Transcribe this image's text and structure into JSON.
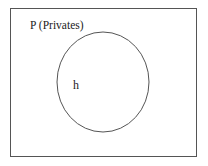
{
  "diagram": {
    "type": "venn",
    "universe": {
      "label": "P (Privates)"
    },
    "sets": [
      {
        "label": "h"
      }
    ],
    "colors": {
      "stroke": "#555555",
      "background": "#ffffff",
      "text": "#222222"
    }
  }
}
